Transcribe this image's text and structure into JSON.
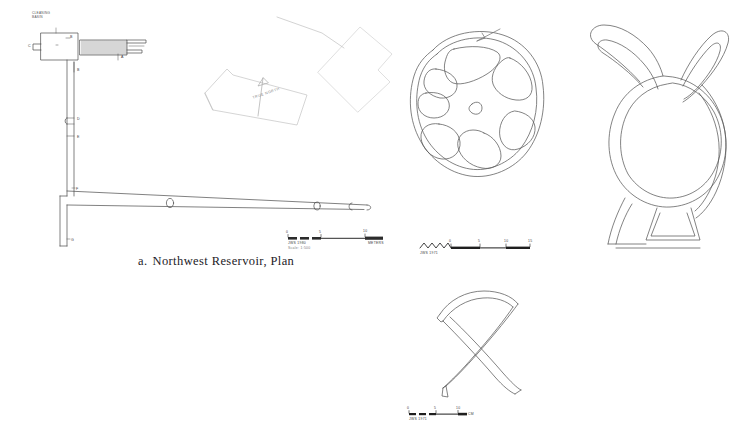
{
  "plate": {
    "background_color": "#ffffff",
    "ink_color": "#4a4a4a",
    "caption_color": "#23211f"
  },
  "caption": {
    "label": "a.",
    "text": "Northwest Reservoir, Plan"
  },
  "plan": {
    "name": "northwest-reservoir-plan",
    "basin_label": "CLEANING\nBASIN",
    "point_labels": [
      {
        "id": "a",
        "text": "A",
        "x": 122,
        "y": 58
      },
      {
        "id": "b1",
        "text": "B",
        "x": 71,
        "y": 42
      },
      {
        "id": "b2",
        "text": "B",
        "x": 78,
        "y": 70
      },
      {
        "id": "c",
        "text": "C",
        "x": 33,
        "y": 47
      },
      {
        "id": "d",
        "text": "D",
        "x": 76,
        "y": 119
      },
      {
        "id": "e",
        "text": "E",
        "x": 76,
        "y": 138
      },
      {
        "id": "f",
        "text": "F",
        "x": 73,
        "y": 189
      },
      {
        "id": "g",
        "text": "G",
        "x": 71,
        "y": 240
      }
    ]
  },
  "north_arrow": {
    "label": "TRUE NORTH"
  },
  "scale_bars": [
    {
      "id": "plan-scale",
      "ticks": [
        "0",
        "5",
        "10"
      ],
      "unit_label": "METERS",
      "credit": "JWS   1980",
      "credit_sub": "Scale: 1:500"
    },
    {
      "id": "mark-scale-upper",
      "ticks": [
        "0",
        "5",
        "10",
        "15"
      ],
      "unit_label": "CM",
      "credit": "JWS 1971"
    },
    {
      "id": "mark-scale-lower",
      "ticks": [
        "0",
        "5",
        "10"
      ],
      "unit_label": "CM",
      "credit": "JWS 1971"
    }
  ],
  "masons_marks": [
    {
      "id": "rosette-mark",
      "name": "rosette-wheel-mark"
    },
    {
      "id": "vessel-mark",
      "name": "horned-vessel-mark"
    },
    {
      "id": "x-mark",
      "name": "crossed-x-mark"
    }
  ]
}
